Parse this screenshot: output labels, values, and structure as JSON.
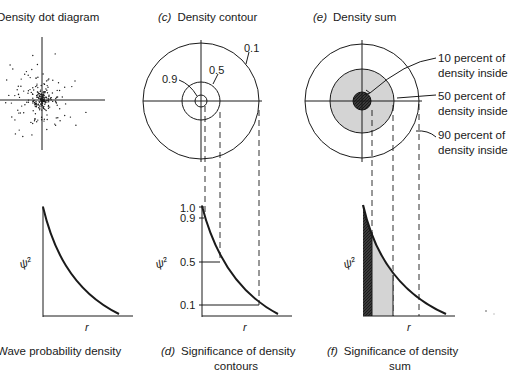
{
  "panels": {
    "a": {
      "letter": "(a)",
      "title": "Density dot diagram"
    },
    "b": {
      "letter": "(b)",
      "caption": "Wave probability density",
      "ylabel": "ψ²",
      "xlabel": "r"
    },
    "c": {
      "letter": "(c)",
      "title": "Density contour",
      "contour_labels": [
        "0.9",
        "0.5",
        "0.1"
      ]
    },
    "d": {
      "letter": "(d)",
      "caption_line1": "Significance of density",
      "caption_line2": "contours",
      "ylabel": "ψ²",
      "xlabel": "r",
      "ticks": [
        "1.0",
        "0.9",
        "0.5",
        "0.1"
      ]
    },
    "e": {
      "letter": "(e)",
      "title": "Density sum",
      "annotations": [
        {
          "line1": "10 percent of",
          "line2": "density inside"
        },
        {
          "line1": "50 percent of",
          "line2": "density inside"
        },
        {
          "line1": "90 percent of",
          "line2": "density inside"
        }
      ]
    },
    "f": {
      "letter": "(f)",
      "caption_line1": "Significance of density",
      "caption_line2": "sum",
      "ylabel": "ψ²",
      "xlabel": "r"
    }
  },
  "colors": {
    "ink": "#1a1a1a",
    "light_fill": "#d4d4d4",
    "dark_fill": "#2a2a2a"
  }
}
